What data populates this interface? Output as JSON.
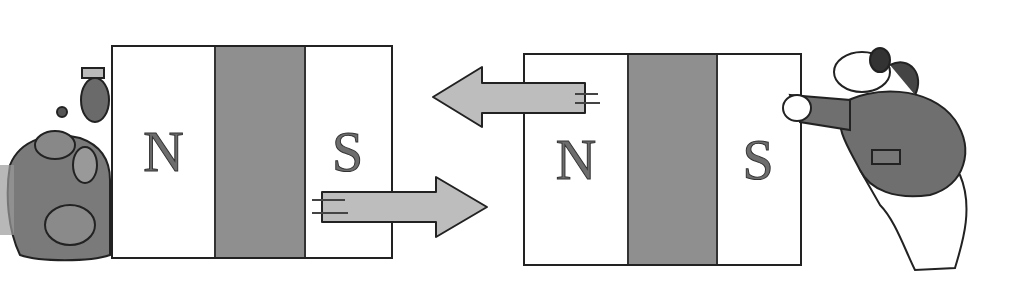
{
  "illustration": {
    "description": "Cartoon of two bar magnets repelling: like poles facing (S facing N side arrangement) with arrows showing forces",
    "colors": {
      "background": "#ffffff",
      "magnet_middle": "#8f8f8f",
      "arrow_fill": "#bdbdbd",
      "outline": "#222222",
      "letter_fill": "#6d6d6d"
    },
    "left_magnet": {
      "left_pole": "N",
      "right_pole": "S"
    },
    "right_magnet": {
      "left_pole": "N",
      "right_pole": "S"
    },
    "arrows": [
      {
        "direction": "left",
        "label": "force-arrow-left"
      },
      {
        "direction": "right",
        "label": "force-arrow-right"
      }
    ],
    "characters": {
      "left": "group of cartoon creatures huddled behind left magnet",
      "right": "bear in a jacket pushing right magnet"
    }
  }
}
